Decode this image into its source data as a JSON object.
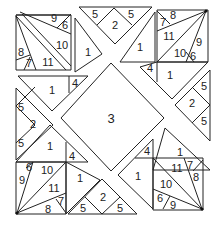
{
  "diagram": {
    "type": "numbered-tangram-quilt-puzzle",
    "center_label": "3",
    "top_left_block": {
      "labels": [
        "9",
        "6",
        "10",
        "8",
        "7",
        "11"
      ]
    },
    "top_center_block": {
      "labels": [
        "5",
        "2",
        "5"
      ]
    },
    "top_center_left_piece": "1",
    "top_center_right_piece": "1",
    "top_right_block": {
      "labels": [
        "7",
        "8",
        "11",
        "9",
        "10",
        "6"
      ]
    },
    "upper_left_piece": {
      "main": "1",
      "small": "4"
    },
    "upper_right_piece": {
      "main": "1",
      "small": "4"
    },
    "left_block": {
      "labels": [
        "5",
        "2",
        "5"
      ]
    },
    "right_block": {
      "labels": [
        "5",
        "2",
        "5"
      ]
    },
    "lower_left_piece": {
      "main": "1",
      "small": "4"
    },
    "lower_right_piece": {
      "main": "1",
      "small": "4"
    },
    "bottom_left_block": {
      "labels": [
        "6",
        "10",
        "9",
        "11",
        "7",
        "8"
      ]
    },
    "bottom_center_block": {
      "labels": [
        "5",
        "2",
        "5"
      ]
    },
    "bottom_right_block": {
      "labels": [
        "11",
        "7",
        "10",
        "8",
        "6",
        "9"
      ]
    }
  }
}
